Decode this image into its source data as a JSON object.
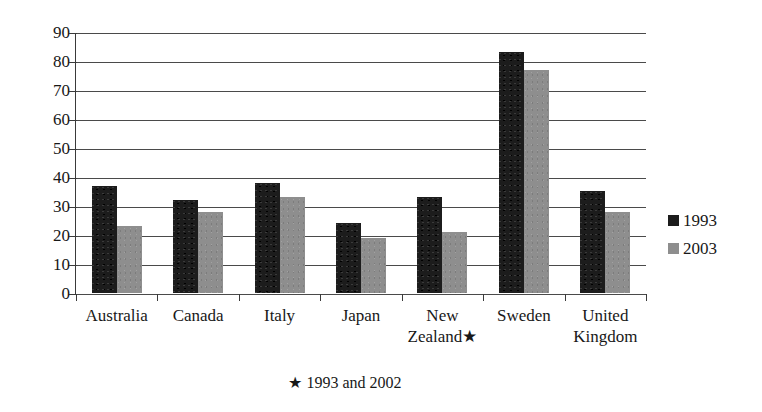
{
  "chart_data": {
    "type": "bar",
    "title": "",
    "subtitle": "",
    "xlabel": "",
    "ylabel": "",
    "ylim": [
      0,
      90
    ],
    "ytick_step": 10,
    "yticks": [
      "90",
      "80",
      "70",
      "60",
      "50",
      "40",
      "30",
      "20",
      "10",
      "0"
    ],
    "grid": true,
    "legend_position": "right",
    "categories": [
      "Australia",
      "Canada",
      "Italy",
      "Japan",
      "New Zealand★",
      "Sweden",
      "United Kingdom"
    ],
    "category_lines": [
      [
        "Australia"
      ],
      [
        "Canada"
      ],
      [
        "Italy"
      ],
      [
        "Japan"
      ],
      [
        "New",
        "Zealand★"
      ],
      [
        "Sweden"
      ],
      [
        "United",
        "Kingdom"
      ]
    ],
    "series": [
      {
        "name": "1993",
        "color": "#1c1c1c",
        "values": [
          37,
          32,
          38,
          24,
          33,
          83,
          35
        ]
      },
      {
        "name": "2003",
        "color": "#8e8e8e",
        "values": [
          23,
          28,
          33,
          19,
          21,
          77,
          28
        ]
      }
    ],
    "annotations": [
      "★ 1993 and 2002"
    ]
  },
  "legend": {
    "items": [
      {
        "label": "1993",
        "color": "#1c1c1c"
      },
      {
        "label": "2003",
        "color": "#8e8e8e"
      }
    ]
  },
  "footnote": {
    "text": "★ 1993 and 2002"
  }
}
